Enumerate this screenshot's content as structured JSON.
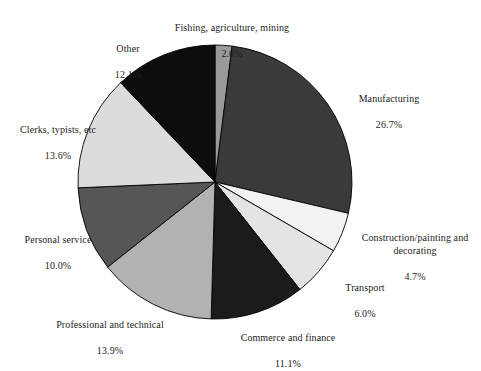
{
  "chart_data": {
    "type": "pie",
    "title": "",
    "subtitle": "",
    "xlabel": "",
    "ylabel": "",
    "legend_position": "none",
    "grid": false,
    "start_angle_deg": 0,
    "direction": "clockwise",
    "units": "percent",
    "categories": [
      "Fishing, agriculture, mining",
      "Manufacturing",
      "Construction/painting and decorating",
      "Transport",
      "Commerce and finance",
      "Professional and technical",
      "Personal service",
      "Clerks, typists, etc",
      "Other"
    ],
    "values": [
      2.0,
      26.7,
      4.7,
      6.0,
      11.1,
      13.9,
      10.0,
      13.6,
      12.1
    ],
    "colors": [
      "#9a9a9a",
      "#3a3a3a",
      "#f2f2f2",
      "#e4e4e4",
      "#1b1b1b",
      "#b2b2b2",
      "#565656",
      "#dcdcdc",
      "#0d0d0d"
    ],
    "slices": [
      {
        "label": "Fishing, agriculture, mining",
        "value_text": "2.0%",
        "value": 2.0,
        "color": "#9a9a9a"
      },
      {
        "label": "Manufacturing",
        "value_text": "26.7%",
        "value": 26.7,
        "color": "#3a3a3a"
      },
      {
        "label": "Construction/painting and\ndecorating",
        "value_text": "4.7%",
        "value": 4.7,
        "color": "#f2f2f2"
      },
      {
        "label": "Transport",
        "value_text": "6.0%",
        "value": 6.0,
        "color": "#e4e4e4"
      },
      {
        "label": "Commerce and finance",
        "value_text": "11.1%",
        "value": 11.1,
        "color": "#1b1b1b"
      },
      {
        "label": "Professional and technical",
        "value_text": "13.9%",
        "value": 13.9,
        "color": "#b2b2b2"
      },
      {
        "label": "Personal service",
        "value_text": "10.0%",
        "value": 10.0,
        "color": "#565656"
      },
      {
        "label": "Clerks, typists, etc",
        "value_text": "13.6%",
        "value": 13.6,
        "color": "#dcdcdc"
      },
      {
        "label": "Other",
        "value_text": "12.1%",
        "value": 12.1,
        "color": "#0d0d0d"
      }
    ],
    "geometry": {
      "cx": 215,
      "cy": 182,
      "r": 137
    }
  },
  "labels": {
    "fishing": {
      "name": "Fishing, agriculture, mining",
      "value": "2.0%"
    },
    "manufacturing": {
      "name": "Manufacturing",
      "value": "26.7%"
    },
    "construction": {
      "name": "Construction/painting and decorating",
      "value": "4.7%"
    },
    "transport": {
      "name": "Transport",
      "value": "6.0%"
    },
    "commerce": {
      "name": "Commerce and finance",
      "value": "11.1%"
    },
    "professional": {
      "name": "Professional and technical",
      "value": "13.9%"
    },
    "personal": {
      "name": "Personal service",
      "value": "10.0%"
    },
    "clerks": {
      "name": "Clerks, typists, etc",
      "value": "13.6%"
    },
    "other": {
      "name": "Other",
      "value": "12.1%"
    }
  }
}
